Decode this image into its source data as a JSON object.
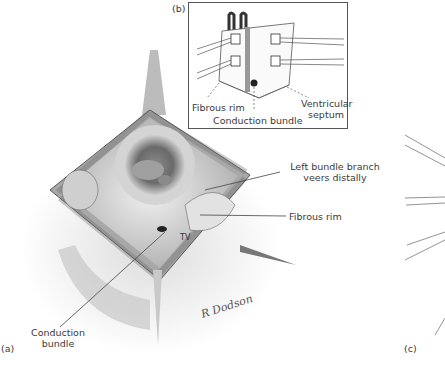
{
  "figure": {
    "panels": [
      {
        "id": "a",
        "label": "(a)"
      },
      {
        "id": "b",
        "label": "(b)"
      },
      {
        "id": "c",
        "label": "(c)"
      }
    ],
    "panel_a": {
      "annotations": {
        "left_bundle_branch": "Left bundle branch\nveers distally",
        "left_bundle_branch_line1": "Left bundle branch",
        "left_bundle_branch_line2": "veers distally",
        "fibrous_rim": "Fibrous rim",
        "tv": "TV",
        "conduction_bundle_line1": "Conduction",
        "conduction_bundle_line2": "bundle",
        "signature": "R Dodson"
      }
    },
    "panel_b": {
      "annotations": {
        "fibrous_rim": "Fibrous rim",
        "conduction_bundle": "Conduction bundle",
        "ventricular_septum_line1": "Ventricular",
        "ventricular_septum_line2": "septum"
      }
    },
    "colors": {
      "line": "#444444",
      "text": "#3a3a3a",
      "tissue_dark": "#5a5a5a",
      "tissue_mid": "#9a9a9a",
      "tissue_light": "#d8d8d8"
    }
  }
}
